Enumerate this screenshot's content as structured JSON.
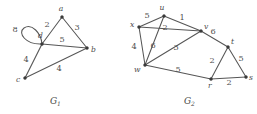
{
  "figure": {
    "background": "#ffffff",
    "edge_color": "#565656",
    "vertex_color": "#3a3a3a",
    "label_color": "#4a4a4a"
  },
  "graphs": [
    {
      "id": "G1",
      "caption": "G",
      "caption_subscript": "1",
      "caption_x": 52,
      "caption_y": 103,
      "vertices": [
        {
          "id": "a",
          "label": "a",
          "x": 62,
          "y": 17,
          "label_x": 61,
          "label_y": 11
        },
        {
          "id": "b",
          "label": "b",
          "x": 87,
          "y": 48,
          "label_x": 91,
          "label_y": 51
        },
        {
          "id": "c",
          "label": "c",
          "x": 25,
          "y": 78,
          "label_x": 17,
          "label_y": 81
        },
        {
          "id": "d",
          "label": "d",
          "x": 42,
          "y": 44,
          "label_x": 40,
          "label_y": 36
        }
      ],
      "edges": [
        {
          "from": "d",
          "to": "a",
          "weight": "2",
          "wx": 47,
          "wy": 26
        },
        {
          "from": "a",
          "to": "b",
          "weight": "3",
          "wx": 76,
          "wy": 29
        },
        {
          "from": "d",
          "to": "b",
          "weight": "5",
          "wx": 62,
          "wy": 41
        },
        {
          "from": "d",
          "to": "c",
          "weight": "4",
          "wx": 27,
          "wy": 60
        },
        {
          "from": "c",
          "to": "b",
          "weight": "4",
          "wx": 59,
          "wy": 69
        }
      ],
      "loops": [
        {
          "at": "d",
          "weight": "8",
          "wx": 17,
          "wy": 31,
          "path": "M 42 44 C 28 44 20 34 25 29 C 30 24 40 32 42 44 Z"
        }
      ]
    },
    {
      "id": "G2",
      "caption": "G",
      "caption_subscript": "2",
      "caption_x": 186,
      "caption_y": 103,
      "vertices": [
        {
          "id": "x",
          "label": "x",
          "x": 139,
          "y": 27,
          "label_x": 131,
          "label_y": 25
        },
        {
          "id": "u",
          "label": "u",
          "x": 164,
          "y": 16,
          "label_x": 162,
          "label_y": 10
        },
        {
          "id": "v",
          "label": "v",
          "x": 201,
          "y": 31,
          "label_x": 203,
          "label_y": 28
        },
        {
          "id": "w",
          "label": "w",
          "x": 145,
          "y": 65,
          "label_x": 136,
          "label_y": 71
        },
        {
          "id": "t",
          "label": "t",
          "x": 228,
          "y": 47,
          "label_x": 231,
          "label_y": 44
        },
        {
          "id": "s",
          "label": "s",
          "x": 246,
          "y": 77,
          "label_x": 249,
          "label_y": 79
        },
        {
          "id": "r",
          "label": "r",
          "x": 211,
          "y": 79,
          "label_x": 210,
          "label_y": 86
        }
      ],
      "edges": [
        {
          "from": "x",
          "to": "u",
          "weight": "5",
          "wx": 147,
          "wy": 17
        },
        {
          "from": "u",
          "to": "v",
          "weight": "1",
          "wx": 182,
          "wy": 19
        },
        {
          "from": "u",
          "to": "w",
          "weight": "2",
          "wx": 166,
          "wy": 28
        },
        {
          "from": "x",
          "to": "v",
          "weight": "",
          "wx": 0,
          "wy": 0
        },
        {
          "from": "x",
          "to": "w",
          "weight": "4",
          "wx": 135,
          "wy": 48
        },
        {
          "from": "u",
          "to": "x",
          "weight": "",
          "wx": 0,
          "wy": 0
        },
        {
          "from": "w",
          "to": "u2",
          "weight": "6",
          "wx": 153,
          "wy": 47
        },
        {
          "from": "w",
          "to": "v",
          "weight": "3",
          "wx": 177,
          "wy": 49
        },
        {
          "from": "v",
          "to": "t",
          "weight": "6",
          "wx": 214,
          "wy": 33
        },
        {
          "from": "w",
          "to": "r",
          "weight": "5",
          "wx": 178,
          "wy": 71
        },
        {
          "from": "t",
          "to": "r",
          "weight": "2",
          "wx": 213,
          "wy": 62
        },
        {
          "from": "t",
          "to": "s",
          "weight": "5",
          "wx": 242,
          "wy": 60
        },
        {
          "from": "r",
          "to": "s",
          "weight": "2",
          "wx": 229,
          "wy": 83
        }
      ]
    }
  ]
}
